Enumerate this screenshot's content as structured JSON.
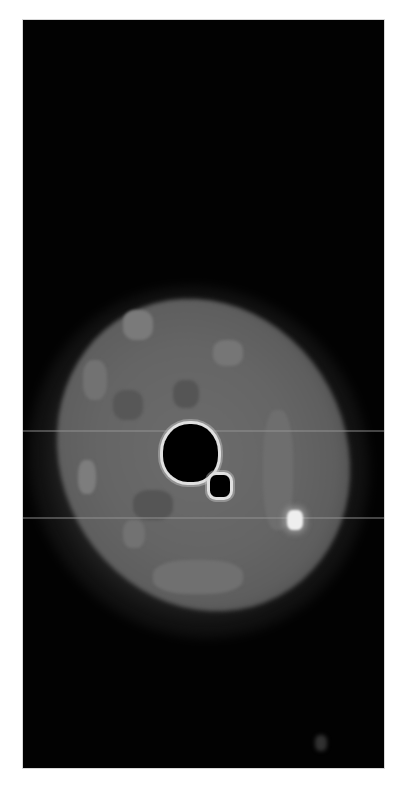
{
  "image": {
    "description": "Grayscale microscopy-style image of an elliptical cell-like body on a black background",
    "background_color": "#020202",
    "frame_color": "#ffffff",
    "features": [
      {
        "name": "cell-body",
        "color": "#666666"
      },
      {
        "name": "dark-vacuole-large",
        "color": "#000000",
        "outline": "#e0e0e0"
      },
      {
        "name": "dark-vacuole-small",
        "color": "#000000",
        "outline": "#e0e0e0"
      },
      {
        "name": "bright-spot",
        "color": "#eeeeee"
      },
      {
        "name": "scan-lines",
        "count": 2,
        "color": "#969696"
      }
    ]
  }
}
